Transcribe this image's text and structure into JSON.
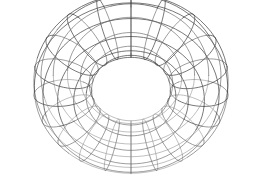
{
  "figure": {
    "kind": "wireframe-3d-mesh",
    "object_name": "torus",
    "alt_text": "Wireframe torus",
    "background_color": "#ffffff",
    "line_color": "#5a5a5a",
    "line_color_dark": "#3d3d3d",
    "line_color_light": "#8a8a8a",
    "line_width": 0.6,
    "canvas": {
      "width": 259,
      "height": 184
    }
  },
  "chart_data": {
    "type": "line",
    "title": "",
    "subtitle": "",
    "xlabel": "",
    "ylabel": "",
    "legend": [],
    "grid": false,
    "mesh": {
      "surface": "torus",
      "major_radius": 1.0,
      "minor_radius": 0.42,
      "major_segments": 20,
      "minor_segments": 12,
      "u_range": [
        0,
        6.283185307179586
      ],
      "v_range": [
        0,
        6.283185307179586
      ]
    },
    "projection": {
      "type": "perspective",
      "elevation_deg": 28,
      "azimuth_deg": 0,
      "roll_deg": 0,
      "camera_distance": 5.2,
      "focal_length": 3.15,
      "center_x": 131,
      "center_y": 92,
      "scale": 112
    },
    "extents": {
      "outer_left_x": 18,
      "outer_right_x": 245,
      "outer_top_y": 10,
      "outer_bottom_y": 172,
      "hole_left_x": 95,
      "hole_right_x": 175,
      "hole_top_y": 42,
      "hole_bottom_y": 88
    },
    "annotations": []
  }
}
